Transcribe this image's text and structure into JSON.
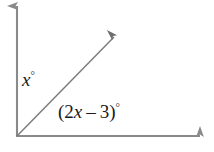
{
  "figure": {
    "kind": "angle-diagram",
    "width": 214,
    "height": 152,
    "background_color": "#ffffff",
    "stroke_color": "#8a8a8a",
    "text_color": "#1a1a1a"
  },
  "labels": {
    "upper_angle": {
      "full_text": "x°",
      "variable": "x",
      "degree_symbol": "°"
    },
    "lower_angle": {
      "full_text": "(2x – 3)°",
      "open_paren": "(",
      "coefficient": "2",
      "variable": "x",
      "operator": "–",
      "constant": "3",
      "close_paren": ")",
      "degree_symbol": "°"
    }
  },
  "geometry": {
    "origin": {
      "x": 17,
      "y": 136
    },
    "vertical_axis": {
      "x1": 17,
      "y1": 136,
      "x2": 17,
      "y2": 6,
      "arrow": "up"
    },
    "horizontal_axis": {
      "x1": 17,
      "y1": 136,
      "x2": 200,
      "y2": 136,
      "arrow": "right"
    },
    "diagonal_ray": {
      "x1": 17,
      "y1": 136,
      "x2": 114,
      "y2": 37,
      "arrow": "up-right"
    }
  }
}
